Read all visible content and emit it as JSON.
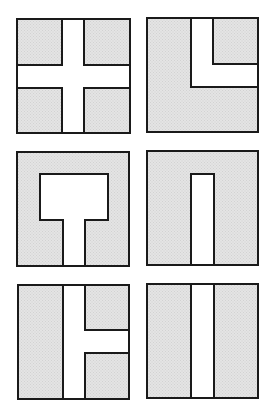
{
  "title": "",
  "colors": {
    "fill": "#e4e4e4",
    "fill_dot": "#d2d2d2",
    "channel": "#ffffff",
    "stroke": "#1a1a1a",
    "background": "#ffffff"
  },
  "stroke_width": 2,
  "panels": [
    {
      "id": "cross",
      "description": "Square with a plus-shaped white channel dividing it into four shaded blocks",
      "box": [
        17,
        19,
        113,
        114
      ],
      "shaded_polys": [
        [
          [
            17,
            19
          ],
          [
            62,
            19
          ],
          [
            62,
            65
          ],
          [
            17,
            65
          ]
        ],
        [
          [
            84,
            19
          ],
          [
            130,
            19
          ],
          [
            130,
            65
          ],
          [
            84,
            65
          ]
        ],
        [
          [
            17,
            88
          ],
          [
            62,
            88
          ],
          [
            62,
            133
          ],
          [
            17,
            133
          ]
        ],
        [
          [
            84,
            88
          ],
          [
            130,
            88
          ],
          [
            130,
            133
          ],
          [
            84,
            133
          ]
        ]
      ]
    },
    {
      "id": "l-channel",
      "description": "Square with an L-shaped white channel isolating the upper-right block",
      "box": [
        147,
        18,
        111,
        114
      ],
      "shaded_polys": [
        [
          [
            147,
            18
          ],
          [
            191,
            18
          ],
          [
            191,
            87
          ],
          [
            258,
            87
          ],
          [
            258,
            132
          ],
          [
            147,
            132
          ]
        ],
        [
          [
            213,
            18
          ],
          [
            258,
            18
          ],
          [
            258,
            64
          ],
          [
            213,
            64
          ]
        ]
      ]
    },
    {
      "id": "t-cavity",
      "description": "Square with a T-shaped white cavity: rectangular chamber with stem to bottom edge",
      "box": [
        17,
        152,
        112,
        114
      ],
      "shaded_polys": [
        [
          [
            17,
            152
          ],
          [
            129,
            152
          ],
          [
            129,
            266
          ],
          [
            85,
            266
          ],
          [
            85,
            220
          ],
          [
            108,
            220
          ],
          [
            108,
            174
          ],
          [
            40,
            174
          ],
          [
            40,
            220
          ],
          [
            63,
            220
          ],
          [
            63,
            266
          ],
          [
            17,
            266
          ]
        ]
      ]
    },
    {
      "id": "slot",
      "description": "Square with a narrow white slot rising from the bottom edge",
      "box": [
        147,
        151,
        111,
        114
      ],
      "shaded_polys": [
        [
          [
            147,
            151
          ],
          [
            258,
            151
          ],
          [
            258,
            265
          ],
          [
            214,
            265
          ],
          [
            214,
            174
          ],
          [
            191,
            174
          ],
          [
            191,
            265
          ],
          [
            147,
            265
          ]
        ]
      ]
    },
    {
      "id": "t-branch",
      "description": "Square with a full vertical white channel and a branch to the right edge",
      "box": [
        18,
        285,
        111,
        114
      ],
      "shaded_polys": [
        [
          [
            18,
            285
          ],
          [
            63,
            285
          ],
          [
            63,
            399
          ],
          [
            18,
            399
          ]
        ],
        [
          [
            85,
            285
          ],
          [
            129,
            285
          ],
          [
            129,
            330
          ],
          [
            85,
            330
          ]
        ],
        [
          [
            85,
            353
          ],
          [
            129,
            353
          ],
          [
            129,
            399
          ],
          [
            85,
            399
          ]
        ]
      ]
    },
    {
      "id": "split",
      "description": "Square divided by a full vertical white channel into two shaded halves",
      "box": [
        147,
        284,
        111,
        114
      ],
      "shaded_polys": [
        [
          [
            147,
            284
          ],
          [
            191,
            284
          ],
          [
            191,
            398
          ],
          [
            147,
            398
          ]
        ],
        [
          [
            214,
            284
          ],
          [
            258,
            284
          ],
          [
            258,
            398
          ],
          [
            214,
            398
          ]
        ]
      ]
    }
  ]
}
